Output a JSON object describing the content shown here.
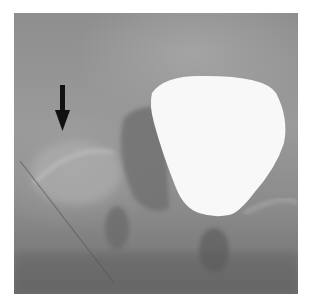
{
  "image": {
    "type": "radiograph",
    "description": "Pelvic X-ray showing contrast-filled bladder with arrow pointing to hip region",
    "annotation": {
      "type": "arrow",
      "direction": "down",
      "color": "#111111"
    },
    "colors": {
      "background": "#ffffff",
      "bladder": "#f8f8f8",
      "film": "#8e8e8e"
    }
  }
}
